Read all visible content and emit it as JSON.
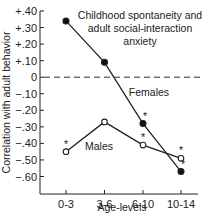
{
  "chart_data": {
    "type": "line",
    "title_lines": [
      "Childhood spontaneity and",
      "adult social-interaction",
      "anxiety"
    ],
    "xlabel": "Age-levels",
    "ylabel": "Correlation with adult behavior",
    "categories": [
      "0-3",
      "3-6",
      "6-10",
      "10-14"
    ],
    "ylim": [
      -0.6,
      0.4
    ],
    "yticks": [
      "+.40",
      "+.30",
      "+.20",
      "+.10",
      "0",
      "-.10",
      "-.20",
      "-.30",
      "-.40",
      "-.50",
      "-.60"
    ],
    "reference_line": {
      "y": 0,
      "style": "dashed"
    },
    "grid": false,
    "series": [
      {
        "name": "Females",
        "marker": "filled-circle",
        "values": [
          0.34,
          0.09,
          -0.28,
          -0.57
        ],
        "significant": [
          false,
          false,
          true,
          true
        ]
      },
      {
        "name": "Males",
        "marker": "open-circle",
        "values": [
          -0.45,
          -0.27,
          -0.41,
          -0.49
        ],
        "significant": [
          true,
          false,
          true,
          true
        ]
      }
    ],
    "annotations": [
      "*"
    ]
  }
}
